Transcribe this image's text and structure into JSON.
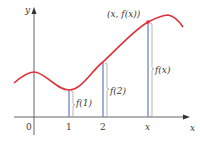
{
  "figure": {
    "colors": {
      "curve": "#e0303a",
      "segments": "#6f86c8",
      "axes": "#555555",
      "braces": "#9a9a9a",
      "text": "#3a3a3a"
    },
    "axes": {
      "x_label": "x",
      "y_label": "y",
      "ticks": [
        {
          "label": "0"
        },
        {
          "label": "1"
        },
        {
          "label": "2"
        },
        {
          "label": "x"
        }
      ]
    },
    "point_label": "(x, f(x))",
    "heights": [
      {
        "label": "f(1)"
      },
      {
        "label": "f(2)"
      },
      {
        "label": "f(x)"
      }
    ]
  }
}
